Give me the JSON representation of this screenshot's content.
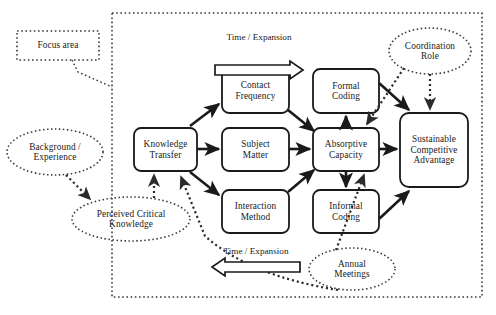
{
  "diagram": {
    "type": "flow-diagram",
    "colors": {
      "stroke": "#1a1a1a",
      "background": "#ffffff",
      "dotted": "#3a3a3a"
    },
    "focus_box": {
      "label": "Focus area",
      "style": "dotted-rectangle"
    },
    "boundary": {
      "label": "focus-area-boundary",
      "style": "dotted-rectangle"
    },
    "process_boxes": [
      {
        "id": "knowledge-transfer",
        "label": "Knowledge\nTransfer"
      },
      {
        "id": "contact-frequency",
        "label": "Contact\nFrequency"
      },
      {
        "id": "subject-matter",
        "label": "Subject\nMatter"
      },
      {
        "id": "interaction-method",
        "label": "Interaction\nMethod"
      },
      {
        "id": "formal-coding",
        "label": "Formal\nCoding"
      },
      {
        "id": "absorptive-capacity",
        "label": "Absorptive\nCapacity"
      },
      {
        "id": "informal-coding",
        "label": "Informal\nCoding"
      },
      {
        "id": "sustainable-competitive-advantage",
        "label": "Sustainable\nCompetitive\nAdvantage"
      }
    ],
    "ellipses": [
      {
        "id": "background-experience",
        "label": "Background /\nExperience"
      },
      {
        "id": "perceived-critical-knowledge",
        "label": "Perceived Critical\nKnowledge"
      },
      {
        "id": "coordination-role",
        "label": "Coordination\nRole"
      },
      {
        "id": "annual-meetings",
        "label": "Annual\nMeetings"
      }
    ],
    "axis_arrows": [
      {
        "id": "time-expansion-top",
        "label": "Time / Expansion",
        "direction": "right"
      },
      {
        "id": "time-expansion-bottom",
        "label": "Time / Expansion",
        "direction": "left"
      }
    ]
  }
}
